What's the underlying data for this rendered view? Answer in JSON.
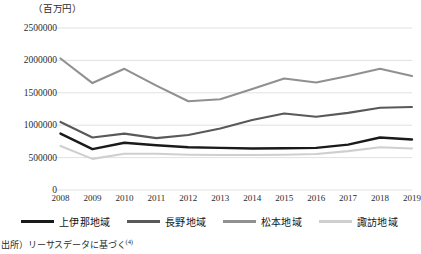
{
  "chart_data": {
    "type": "line",
    "title": "",
    "unit_label": "（百万円）",
    "xlabel": "",
    "ylabel": "",
    "categories": [
      "2008",
      "2009",
      "2010",
      "2011",
      "2012",
      "2013",
      "2014",
      "2015",
      "2016",
      "2017",
      "2018",
      "2019"
    ],
    "yticks": [
      "0",
      "500000",
      "1000000",
      "1500000",
      "2000000",
      "2500000"
    ],
    "ylim": [
      0,
      2500000
    ],
    "grid": true,
    "legend_position": "bottom",
    "series": [
      {
        "name": "上伊那地域",
        "color": "#1a1a1a",
        "values": [
          870000,
          630000,
          730000,
          690000,
          660000,
          650000,
          640000,
          645000,
          650000,
          700000,
          810000,
          780000
        ]
      },
      {
        "name": "長野地域",
        "color": "#595959",
        "values": [
          1050000,
          810000,
          870000,
          800000,
          850000,
          950000,
          1080000,
          1180000,
          1130000,
          1190000,
          1270000,
          1280000
        ]
      },
      {
        "name": "松本地域",
        "color": "#909090",
        "values": [
          2030000,
          1650000,
          1870000,
          1610000,
          1370000,
          1400000,
          1560000,
          1720000,
          1660000,
          1760000,
          1870000,
          1760000
        ]
      },
      {
        "name": "諏訪地域",
        "color": "#cfcfcf",
        "values": [
          680000,
          480000,
          560000,
          560000,
          545000,
          540000,
          540000,
          545000,
          555000,
          600000,
          660000,
          640000
        ]
      }
    ]
  },
  "source": {
    "text": "出所）リーサスデータに基づく",
    "footnote": "(4)"
  }
}
